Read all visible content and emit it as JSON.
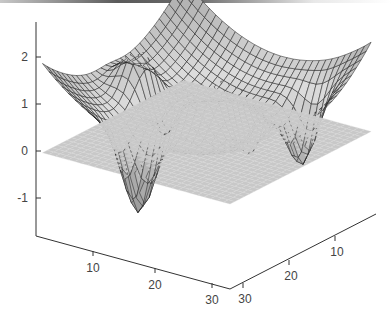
{
  "chart_data": {
    "type": "surface",
    "title": "",
    "grid": {
      "nx": 30,
      "ny": 30
    },
    "x_axis": {
      "label": "",
      "ticks": [
        10,
        20,
        30
      ],
      "range": [
        1,
        30
      ]
    },
    "y_axis": {
      "label": "",
      "ticks": [
        10,
        20,
        30
      ],
      "range": [
        1,
        30
      ]
    },
    "z_axis": {
      "label": "",
      "ticks": [
        -1,
        0,
        1,
        2
      ],
      "range": [
        -1.8,
        2.8
      ]
    },
    "features": [
      {
        "kind": "central-peak",
        "x": 15.5,
        "y": 15.5,
        "z": 2.7
      },
      {
        "kind": "side-peak",
        "x": 8,
        "y": 15.5,
        "z": 1.3
      },
      {
        "kind": "side-peak",
        "x": 23,
        "y": 15.5,
        "z": 1.6
      },
      {
        "kind": "corner-rise",
        "z": 1.1
      },
      {
        "kind": "trough",
        "z": -1.5
      }
    ],
    "plane": {
      "z": 0,
      "color": "#c8c8c8"
    },
    "mesh_edge_color": "#1a1a1a",
    "colormap": "gray"
  },
  "axes": {
    "z_ticks": [
      {
        "value": 2,
        "label": "2"
      },
      {
        "value": 1,
        "label": "1"
      },
      {
        "value": 0,
        "label": "0"
      },
      {
        "value": -1,
        "label": "-1"
      }
    ],
    "x_ticks": [
      {
        "value": 10,
        "label": "10"
      },
      {
        "value": 20,
        "label": "20"
      },
      {
        "value": 30,
        "label": "30"
      }
    ],
    "y_ticks": [
      {
        "value": 10,
        "label": "10"
      },
      {
        "value": 20,
        "label": "20"
      },
      {
        "value": 30,
        "label": "30"
      }
    ]
  }
}
